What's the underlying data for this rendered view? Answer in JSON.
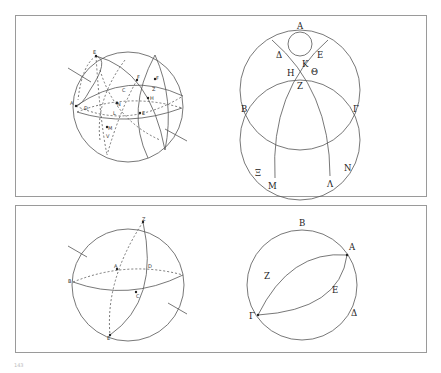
{
  "figures": [
    {
      "id": "top-left-sphere",
      "kind": "sphere-with-great-circles",
      "labels": [
        "E",
        "A",
        "D",
        "C",
        "N",
        "F",
        "F",
        "Z",
        "H",
        "E",
        "L",
        "M",
        "V"
      ]
    },
    {
      "id": "top-right-planar",
      "kind": "circles-projection",
      "labels": [
        "Α",
        "Δ",
        "Ε",
        "Κ",
        "Η",
        "Θ",
        "Ζ",
        "Β",
        "Γ",
        "Ξ",
        "Μ",
        "Λ",
        "Ν"
      ]
    },
    {
      "id": "bottom-left-sphere",
      "kind": "sphere-with-two-great-circles",
      "labels": [
        "Z",
        "A",
        "D",
        "B",
        "C",
        "E"
      ]
    },
    {
      "id": "bottom-right-planar",
      "kind": "circle-with-lune",
      "labels": [
        "Β",
        "Α",
        "Ζ",
        "Ε",
        "Γ",
        "Δ"
      ]
    }
  ],
  "tl": {
    "E1": "E",
    "A": "A",
    "D": "D",
    "C": "C",
    "N": "N",
    "F1": "F",
    "F2": "F",
    "Z": "Z",
    "H": "H",
    "E2": "E",
    "L": "L",
    "M": "M",
    "V": "V"
  },
  "tr": {
    "A": "Α",
    "D": "Δ",
    "E": "Ε",
    "K": "Κ",
    "H": "Η",
    "TH": "Θ",
    "Z": "Ζ",
    "B": "Β",
    "G": "Γ",
    "X": "Ξ",
    "M": "Μ",
    "L": "Λ",
    "N": "Ν"
  },
  "bl": {
    "Z": "Z",
    "A": "A",
    "D": "D",
    "B": "B",
    "C": "C",
    "E": "E"
  },
  "br": {
    "B": "Β",
    "A": "Α",
    "Z": "Ζ",
    "E": "Ε",
    "G": "Γ",
    "D": "Δ"
  },
  "page_number": "143"
}
